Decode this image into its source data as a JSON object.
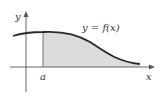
{
  "diagram": {
    "type": "area-under-curve",
    "curve_label": "y = f(x)",
    "x_axis_label": "x",
    "y_axis_label": "y",
    "lower_bound_label": "a",
    "shaded_region": "area under f(x) from x = a to the right",
    "colors": {
      "curve": "#2a2a2a",
      "axes": "#555555",
      "shade": "#dcdcdc",
      "background": "#ffffff"
    }
  }
}
